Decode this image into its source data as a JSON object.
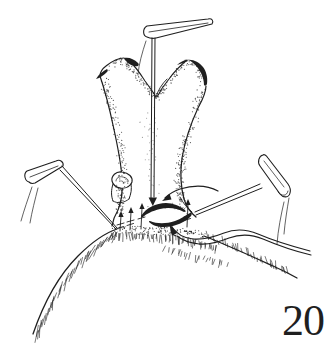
{
  "figure": {
    "number": "20"
  },
  "colors": {
    "ink": "#1f1f1f",
    "paper": "#ffffff"
  },
  "illustration": {
    "alt": "Black-and-white scientific line drawing: a forked Y-shaped organ rising from a domed, hair-fringed body surface, held by one vertical insect pin and two angled insect pins; small arrows and a dark slit mark structures at the base; a wavy membrane ribbon trails to the right."
  }
}
